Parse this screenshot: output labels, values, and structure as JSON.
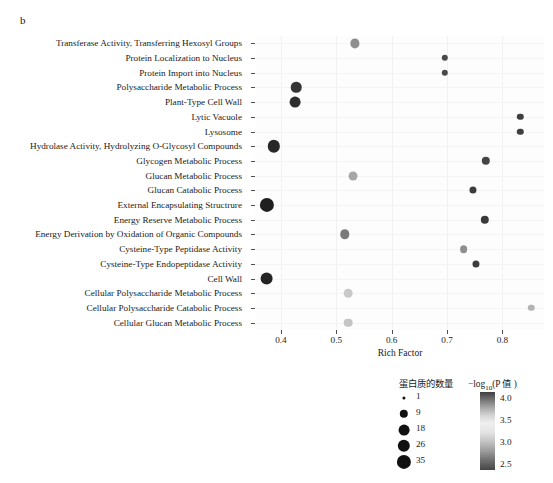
{
  "panel": {
    "label": "b"
  },
  "chart_data": {
    "type": "scatter",
    "title": "",
    "subtitle": "",
    "xlabel": "Rich Factor",
    "ylabel": "GO TERM",
    "xlim": [
      0.355,
      0.875
    ],
    "ylim_rows": 20,
    "grid": true,
    "legend_position": "bottom-right",
    "x_ticks": [
      0.4,
      0.5,
      0.6,
      0.7,
      0.8
    ],
    "x_tick_labels": [
      "0.4",
      "0.5",
      "0.6",
      "0.7",
      "0.8"
    ],
    "categories": [
      "Transferase Activity, Transferring Hexosyl Groups",
      "Protein Localization to Nucleus",
      "Protein Import into Nucleus",
      "Polysaccharide Metabolic Process",
      "Plant-Type Cell Wall",
      "Lytic Vacuole",
      "Lysosome",
      "Hydrolase Activity, Hydrolyzing O-Glycosyl Compounds",
      "Glycogen Metabolic Process",
      "Glucan Metabolic Process",
      "Glucan Catabolic Process",
      "External Encapsulating Structrure",
      "Energy Reserve Metabolic Process",
      "Energy Derivation by Oxidation of Organic Compounds",
      "Cysteine-Type Peptidase Activity",
      "Cysteine-Type Endopeptidase Activity",
      "Cell Wall",
      "Cellular Polysaccharide Metabolic Process",
      "Cellular Polysaccharide Catabolic Process",
      "Cellular Glucan Metabolic Process"
    ],
    "points": [
      {
        "term": "Transferase Activity, Transferring Hexosyl Groups",
        "rich_factor": 0.533,
        "count": 12,
        "neglog10p": 3.3,
        "color": "#8d8d8d"
      },
      {
        "term": "Protein Localization to Nucleus",
        "rich_factor": 0.696,
        "count": 6,
        "neglog10p": 2.7,
        "color": "#4a4a4a"
      },
      {
        "term": "Protein Import into Nucleus",
        "rich_factor": 0.696,
        "count": 6,
        "neglog10p": 2.7,
        "color": "#4a4a4a"
      },
      {
        "term": "Polysaccharide Metabolic Process",
        "rich_factor": 0.428,
        "count": 17,
        "neglog10p": 4.0,
        "color": "#353535"
      },
      {
        "term": "Plant-Type Cell Wall",
        "rich_factor": 0.425,
        "count": 18,
        "neglog10p": 4.0,
        "color": "#2e2e2e"
      },
      {
        "term": "Lytic Vacuole",
        "rich_factor": 0.832,
        "count": 6,
        "neglog10p": 2.6,
        "color": "#3f3f3f"
      },
      {
        "term": "Lysosome",
        "rich_factor": 0.832,
        "count": 6,
        "neglog10p": 2.6,
        "color": "#3f3f3f"
      },
      {
        "term": "Hydrolase Activity, Hydrolyzing O-Glycosyl Compounds",
        "rich_factor": 0.387,
        "count": 26,
        "neglog10p": 4.1,
        "color": "#282828"
      },
      {
        "term": "Glycogen Metabolic Process",
        "rich_factor": 0.77,
        "count": 9,
        "neglog10p": 2.9,
        "color": "#454545"
      },
      {
        "term": "Glucan Metabolic Process",
        "rich_factor": 0.53,
        "count": 11,
        "neglog10p": 3.55,
        "color": "#a6a6a6"
      },
      {
        "term": "Glucan Catabolic Process",
        "rich_factor": 0.747,
        "count": 7,
        "neglog10p": 2.8,
        "color": "#3c3c3c"
      },
      {
        "term": "External Encapsulating Structrure",
        "rich_factor": 0.375,
        "count": 35,
        "neglog10p": 4.2,
        "color": "#1f1f1f"
      },
      {
        "term": "Energy Reserve Metabolic Process",
        "rich_factor": 0.768,
        "count": 9,
        "neglog10p": 2.9,
        "color": "#3a3a3a"
      },
      {
        "term": "Energy Derivation by Oxidation of Organic Compounds",
        "rich_factor": 0.515,
        "count": 13,
        "neglog10p": 3.4,
        "color": "#7a7a7a"
      },
      {
        "term": "Cysteine-Type Peptidase Activity",
        "rich_factor": 0.73,
        "count": 8,
        "neglog10p": 3.2,
        "color": "#8f8f8f"
      },
      {
        "term": "Cysteine-Type Endopeptidase Activity",
        "rich_factor": 0.752,
        "count": 7,
        "neglog10p": 2.85,
        "color": "#3d3d3d"
      },
      {
        "term": "Cell Wall",
        "rich_factor": 0.374,
        "count": 28,
        "neglog10p": 4.15,
        "color": "#242424"
      },
      {
        "term": "Cellular Polysaccharide Metabolic Process",
        "rich_factor": 0.522,
        "count": 10,
        "neglog10p": 3.6,
        "color": "#c9c9c9"
      },
      {
        "term": "Cellular Polysaccharide Catabolic Process",
        "rich_factor": 0.852,
        "count": 6,
        "neglog10p": 3.55,
        "color": "#b4b4b4"
      },
      {
        "term": "Cellular Glucan Metabolic Process",
        "rich_factor": 0.522,
        "count": 10,
        "neglog10p": 3.6,
        "color": "#c4c4c4"
      }
    ],
    "size_legend": {
      "title": "蛋白质的数量",
      "values": [
        1,
        9,
        18,
        26,
        35
      ],
      "labels": [
        "1",
        "9",
        "18",
        "26",
        "35"
      ],
      "radii_px": [
        1.6,
        4.2,
        5.4,
        6.2,
        7.1
      ]
    },
    "color_legend": {
      "title_prefix": "−log",
      "title_sub": "10",
      "title_suffix": "(P 值 )",
      "ticks": [
        4.0,
        3.5,
        3.0,
        2.5
      ],
      "tick_labels": [
        "4.0",
        "3.5",
        "3.0",
        "2.5"
      ],
      "vmin": 2.5,
      "vmax": 4.0
    }
  }
}
